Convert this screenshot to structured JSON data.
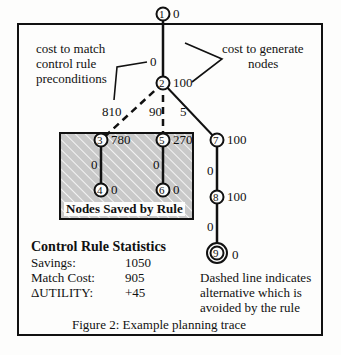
{
  "annotations": {
    "match_cost_label": [
      "cost to match",
      "control rule",
      "preconditions"
    ],
    "generate_cost_label": [
      "cost to generate",
      "nodes"
    ],
    "saved_box_label": "Nodes Saved by Rule",
    "dashed_note": [
      "Dashed line indicates",
      "alternative which is",
      "avoided by the rule"
    ]
  },
  "nodes": [
    {
      "id": "1",
      "cost": "0"
    },
    {
      "id": "2",
      "cost": "100"
    },
    {
      "id": "3",
      "cost": "780"
    },
    {
      "id": "4",
      "cost": "0"
    },
    {
      "id": "5",
      "cost": "270"
    },
    {
      "id": "6",
      "cost": "0"
    },
    {
      "id": "7",
      "cost": "100"
    },
    {
      "id": "8",
      "cost": "100"
    },
    {
      "id": "9",
      "cost": "0"
    }
  ],
  "edges": [
    {
      "from": "1",
      "to": "2",
      "match_cost": "0",
      "style": "solid"
    },
    {
      "from": "2",
      "to": "3",
      "match_cost": "810",
      "style": "dashed"
    },
    {
      "from": "2",
      "to": "5",
      "match_cost": "90",
      "style": "dashed"
    },
    {
      "from": "2",
      "to": "7",
      "match_cost": "5",
      "style": "solid"
    },
    {
      "from": "3",
      "to": "4",
      "match_cost": "0",
      "style": "solid"
    },
    {
      "from": "5",
      "to": "6",
      "match_cost": "0",
      "style": "solid"
    },
    {
      "from": "7",
      "to": "8",
      "match_cost": "0",
      "style": "solid"
    },
    {
      "from": "8",
      "to": "9",
      "match_cost": "0",
      "style": "solid"
    }
  ],
  "stats": {
    "title": "Control Rule Statistics",
    "rows": [
      {
        "label": "Savings:",
        "value": "1050"
      },
      {
        "label": "Match Cost:",
        "value": "905"
      },
      {
        "label": "ΔUTILITY:",
        "value": "+45"
      }
    ]
  },
  "caption": "Figure 2:  Example planning trace"
}
